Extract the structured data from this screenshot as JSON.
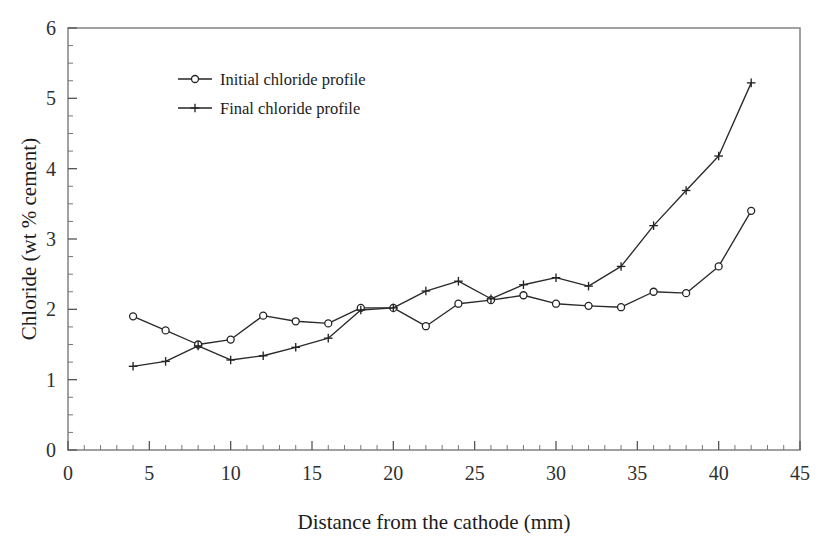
{
  "chart_data": {
    "type": "line",
    "title": "",
    "xlabel": "Distance from the cathode (mm)",
    "ylabel": "Chloride (wt % cement)",
    "xlim": [
      0,
      45
    ],
    "ylim": [
      0,
      6
    ],
    "x_major_ticks": [
      0,
      5,
      10,
      15,
      20,
      25,
      30,
      35,
      40,
      45
    ],
    "x_tick_labels": [
      "0",
      "5",
      "10",
      "15",
      "20",
      "25",
      "30",
      "35",
      "40",
      "45"
    ],
    "x_minor_step": 1,
    "y_major_ticks": [
      0,
      1,
      2,
      3,
      4,
      5,
      6
    ],
    "y_tick_labels": [
      "0",
      "1",
      "2",
      "3",
      "4",
      "5",
      "6"
    ],
    "y_minor_step": 0.25,
    "grid": false,
    "legend_position": "upper-left-inside",
    "x": [
      4,
      6,
      8,
      10,
      12,
      14,
      16,
      18,
      20,
      22,
      24,
      26,
      28,
      30,
      32,
      34,
      36,
      38,
      40,
      42
    ],
    "series": [
      {
        "name": "Initial chloride profile",
        "marker": "open-circle",
        "color": "#242424",
        "values": [
          1.9,
          1.7,
          1.5,
          1.57,
          1.91,
          1.83,
          1.8,
          2.02,
          2.02,
          1.76,
          2.08,
          2.13,
          2.2,
          2.08,
          2.05,
          2.03,
          2.25,
          2.23,
          2.61,
          3.4
        ]
      },
      {
        "name": "Final chloride profile",
        "marker": "plus",
        "color": "#242424",
        "values": [
          1.19,
          1.26,
          1.48,
          1.28,
          1.34,
          1.46,
          1.59,
          1.99,
          2.02,
          2.26,
          2.4,
          2.15,
          2.35,
          2.45,
          2.33,
          2.61,
          3.19,
          3.69,
          4.18,
          5.22
        ]
      }
    ]
  },
  "legend": {
    "entries": [
      {
        "label": "Initial chloride profile",
        "marker": "open-circle"
      },
      {
        "label": "Final chloride profile",
        "marker": "plus"
      }
    ]
  },
  "colors": {
    "background": "#ffffff",
    "ink": "#242424",
    "axis": "#8a8a8a"
  }
}
